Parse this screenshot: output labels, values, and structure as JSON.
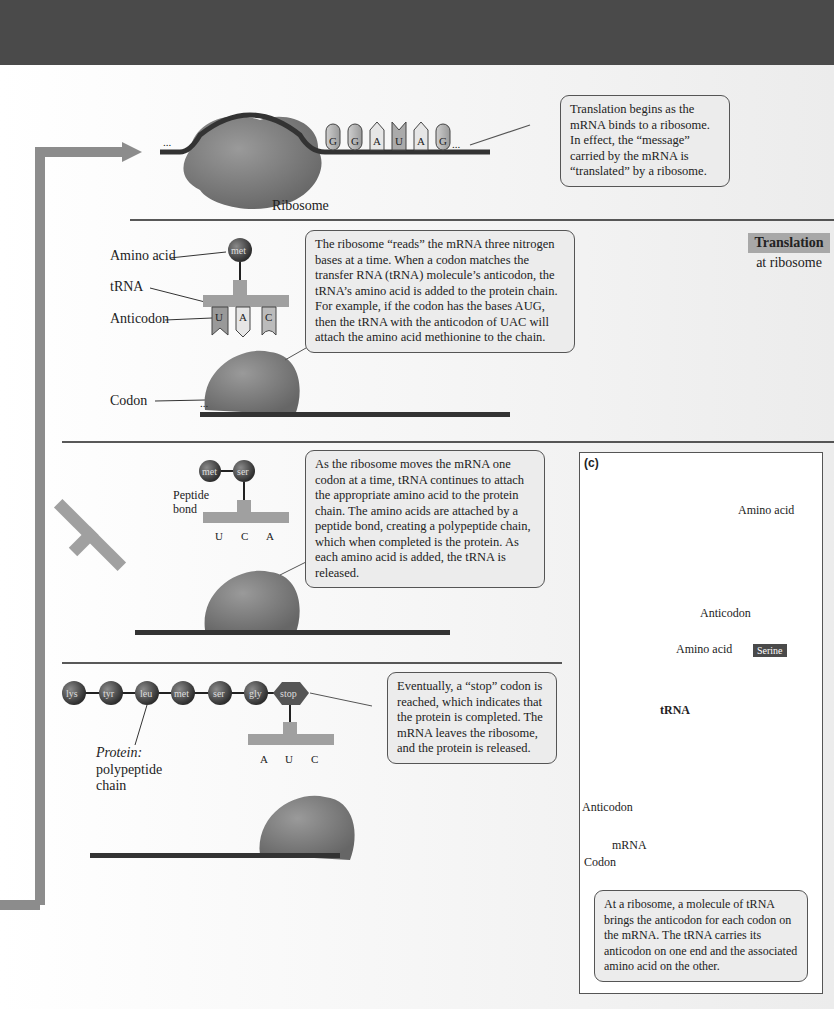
{
  "step1": {
    "mrna_bases_bound": [
      "A",
      "U",
      "G",
      "A",
      "G",
      "U"
    ],
    "mrna_bases_tail": [
      "G",
      "G",
      "A",
      "U",
      "A",
      "G"
    ],
    "ellipsis": "...",
    "ribosome_label": "Ribosome",
    "callout": "Translation begins as the mRNA binds to a ribosome. In effect, the “message” carried by the mRNA is “translated” by a ribosome."
  },
  "section_tag": {
    "title": "Translation",
    "subtitle": "at ribosome"
  },
  "step2": {
    "labels": {
      "amino_acid": "Amino acid",
      "trna": "tRNA",
      "anticodon": "Anticodon",
      "codon": "Codon"
    },
    "amino_acid": "met",
    "anticodon_bases": [
      "U",
      "A",
      "C"
    ],
    "mrna_bases": [
      "A",
      "U",
      "G",
      "A",
      "G",
      "U",
      "G",
      "G",
      "A",
      "U",
      "A",
      "G"
    ],
    "callout": "The ribosome “reads” the mRNA three nitrogen bases at a time. When a codon matches the transfer RNA (tRNA) molecule’s anticodon, the tRNA’s amino acid is added to the protein chain. For example, if the codon has the bases AUG, then the tRNA with the anticodon of UAC will attach the amino acid methionine to the chain."
  },
  "step3": {
    "amino_acids": [
      "met",
      "ser"
    ],
    "peptide_bond_label": "Peptide bond",
    "anticodon_bases": [
      "U",
      "C",
      "A"
    ],
    "released_trna_bases": [
      "U",
      "A",
      "C"
    ],
    "mrna_bases": [
      "A",
      "U",
      "G",
      "A",
      "G",
      "U",
      "G",
      "G",
      "A",
      "U",
      "A",
      "G"
    ],
    "callout": "As the ribosome moves the mRNA one codon at a time, tRNA continues to attach the appropriate amino acid to the protein chain. The amino acids are attached by a peptide bond, creating a polypeptide chain, which when completed is the protein. As each amino acid is added, the tRNA is released."
  },
  "step4": {
    "chain": [
      "lys",
      "tyr",
      "leu",
      "met",
      "ser",
      "gly",
      "stop"
    ],
    "protein_label_italic": "Protein:",
    "protein_label": "polypeptide chain",
    "anticodon_bases": [
      "A",
      "U",
      "C"
    ],
    "mrna_bases": [
      "A",
      "G",
      "U",
      "G",
      "G",
      "A",
      "U",
      "A",
      "G"
    ],
    "callout": "Eventually, a “stop” codon is reached, which indicates that the protein is completed. The mRNA leaves the ribosome, and the protein is released."
  },
  "panel_c": {
    "label": "(c)",
    "model_amino_acid": "Amino acid",
    "model_anticodon": "Anticodon",
    "amino_acid_label": "Amino acid",
    "serine": "Serine",
    "trna_label": "tRNA",
    "anticodon_label": "Anticodon",
    "anticodon_letters": "UCG",
    "codon_letters": "AGC",
    "mrna_label": "mRNA",
    "codon_label": "Codon",
    "callout": "At a ribosome, a molecule of tRNA brings the anticodon for each codon on the mRNA. The tRNA carries its anticodon on one end and the associated amino acid on the other."
  },
  "colors": {
    "banner": "#4a4a4a",
    "arrow": "#8c8c8c",
    "ribosome": "#7a7a7a",
    "bead": "#3f3f3f",
    "trna": "#a0a0a0"
  }
}
